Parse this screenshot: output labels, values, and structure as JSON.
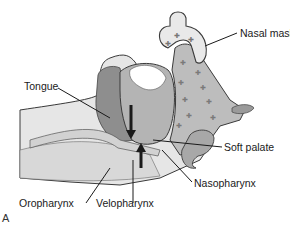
{
  "figure": {
    "panel_label": "A",
    "labels": {
      "nasal_mask": "Nasal mask",
      "tongue": "Tongue",
      "soft_palate": "Soft palate",
      "nasopharynx": "Nasopharynx",
      "oropharynx": "Oropharynx",
      "velopharynx": "Velopharynx"
    },
    "colors": {
      "tissue_dark": "#8a8a8a",
      "tissue_mid": "#a8a8a8",
      "tissue_light": "#c8c8c8",
      "airway": "#e8e8e8",
      "outline": "#3a3a3a",
      "arrow": "#1a1a1a"
    }
  }
}
